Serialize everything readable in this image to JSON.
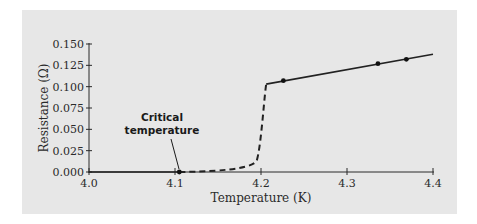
{
  "chart_data": {
    "type": "line",
    "title": "",
    "xlabel": "Temperature (K)",
    "ylabel": "Resistance (Ω)",
    "xlim": [
      4.0,
      4.4
    ],
    "ylim": [
      0.0,
      0.15
    ],
    "grid": false,
    "xticks": [
      "4.0",
      "4.1",
      "4.2",
      "4.3",
      "4.4"
    ],
    "yticks": [
      "0.000",
      "0.025",
      "0.050",
      "0.075",
      "0.100",
      "0.125",
      "0.150"
    ],
    "series": [
      {
        "name": "superconducting (zero resistance)",
        "style": "solid",
        "x": [
          4.0,
          4.105
        ],
        "y": [
          0.0,
          0.0
        ]
      },
      {
        "name": "transition",
        "style": "dashed",
        "x": [
          4.105,
          4.15,
          4.18,
          4.195,
          4.2,
          4.206
        ],
        "y": [
          0.0,
          0.002,
          0.006,
          0.013,
          0.05,
          0.103
        ]
      },
      {
        "name": "normal state",
        "style": "solid",
        "x": [
          4.206,
          4.4
        ],
        "y": [
          0.103,
          0.138
        ]
      }
    ],
    "points": [
      {
        "x": 4.105,
        "y": 0.0
      },
      {
        "x": 4.226,
        "y": 0.107
      },
      {
        "x": 4.336,
        "y": 0.127
      },
      {
        "x": 4.369,
        "y": 0.132
      }
    ],
    "annotations": [
      {
        "text_lines": [
          "Critical",
          "temperature"
        ],
        "points_to": {
          "x": 4.105,
          "y": 0.0
        }
      }
    ],
    "legend": null
  }
}
